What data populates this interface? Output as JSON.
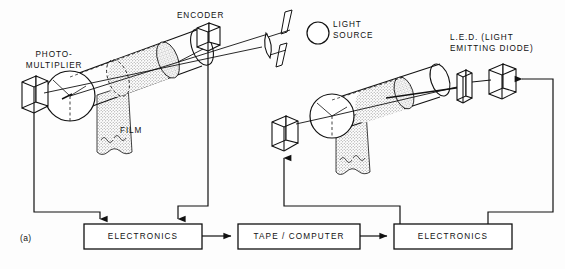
{
  "figure": {
    "id_label": "(a)",
    "caption_labels": {
      "photomultiplier": "PHOTO-\nMULTIPLIER",
      "encoder": "ENCODER",
      "light_source": "LIGHT\nSOURCE",
      "led": "L.E.D. (LIGHT\nEMITTING DIODE)",
      "film": "FILM"
    }
  },
  "blocks": {
    "electronics_left": "ELECTRONICS",
    "tape_computer": "TAPE / COMPUTER",
    "electronics_right": "ELECTRONICS"
  },
  "components": {
    "photomultiplier_detector": "photomultiplier-box",
    "encoder_block": "encoder-box",
    "lens": "lens",
    "slit_upper": "slit-aperture-upper",
    "slit_lower": "slit-aperture-lower",
    "light_source_lamp": "light-source-circle",
    "left_drum": "left-film-drum",
    "right_drum": "right-film-drum",
    "left_film_strip": "left-film-strip",
    "right_film_strip": "right-film-strip",
    "right_detector_box": "right-detector-box",
    "led_window": "led-window-plate",
    "led_block": "led-box"
  },
  "colors": {
    "ink": "#111111",
    "background": "#ffffff",
    "film_fill": "#d8d8d8",
    "drum_fill": "#ffffff"
  }
}
